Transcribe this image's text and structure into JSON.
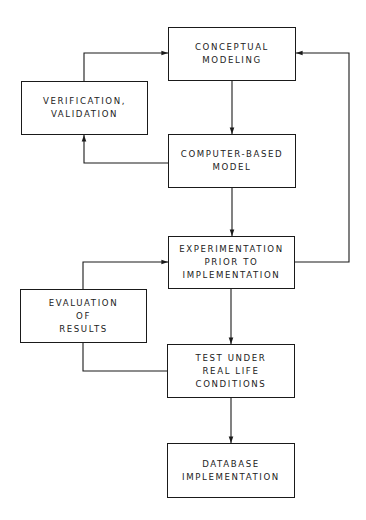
{
  "diagram": {
    "type": "flowchart",
    "colors": {
      "line": "#1a1a1a",
      "text": "#222222",
      "background": "#ffffff"
    },
    "nodes": [
      {
        "id": "conceptual",
        "lines": [
          "CONCEPTUAL",
          "MODELING"
        ],
        "x": 168,
        "y": 27,
        "w": 128,
        "h": 54
      },
      {
        "id": "verification",
        "lines": [
          "VERIFICATION,",
          "VALIDATION"
        ],
        "x": 21,
        "y": 81,
        "w": 127,
        "h": 54
      },
      {
        "id": "computer",
        "lines": [
          "COMPUTER-BASED",
          "MODEL"
        ],
        "x": 168,
        "y": 134,
        "w": 128,
        "h": 54
      },
      {
        "id": "experimentation",
        "lines": [
          "EXPERIMENTATION",
          "PRIOR TO",
          "IMPLEMENTATION"
        ],
        "x": 168,
        "y": 236,
        "w": 127,
        "h": 53
      },
      {
        "id": "evaluation",
        "lines": [
          "EVALUATION",
          "OF",
          "RESULTS"
        ],
        "x": 20,
        "y": 289,
        "w": 127,
        "h": 54
      },
      {
        "id": "test",
        "lines": [
          "TEST UNDER",
          "REAL LIFE",
          "CONDITIONS"
        ],
        "x": 167,
        "y": 344,
        "w": 128,
        "h": 54
      },
      {
        "id": "database",
        "lines": [
          "DATABASE",
          "IMPLEMENTATION"
        ],
        "x": 167,
        "y": 443,
        "w": 128,
        "h": 55
      }
    ],
    "edges": [
      {
        "from": "conceptual",
        "to": "computer"
      },
      {
        "from": "computer",
        "to": "verification"
      },
      {
        "from": "verification",
        "to": "conceptual"
      },
      {
        "from": "computer",
        "to": "experimentation"
      },
      {
        "from": "experimentation",
        "to": "conceptual"
      },
      {
        "from": "test",
        "to": "evaluation"
      },
      {
        "from": "evaluation",
        "to": "experimentation"
      },
      {
        "from": "experimentation",
        "to": "test"
      },
      {
        "from": "test",
        "to": "database"
      }
    ]
  }
}
